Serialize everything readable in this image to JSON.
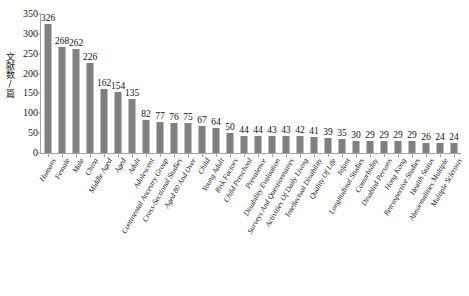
{
  "chart_data": {
    "type": "bar",
    "title": "",
    "subtitle": "",
    "xlabel": "",
    "ylabel": "文献数/篇",
    "ylim": [
      0,
      350
    ],
    "ytick_labels": [
      "0",
      "50",
      "100",
      "150",
      "200",
      "250",
      "300",
      "350"
    ],
    "ytick_values": [
      0,
      50,
      100,
      150,
      200,
      250,
      300,
      350
    ],
    "grid": false,
    "legend": null,
    "bar_color": "#808080",
    "axis_color": "#a6a6a6",
    "categories": [
      "Humans",
      "Female",
      "Male",
      "China",
      "Middle Aged",
      "Aged",
      "Adult",
      "Adolescent",
      "Continental Ancestry Group",
      "Cross-Sectional Studies",
      "Aged 80 And Over",
      "Child",
      "Young Adult",
      "Risk Factors",
      "Child Preschool",
      "Prevalence",
      "Disability Evaluation",
      "Surveys And Questionnaires",
      "Activities Of Daily Living",
      "Intellectual Disability",
      "Quality Of Life",
      "Infant",
      "Longitudinal Studies",
      "Comorbidity",
      "Disabled Persons",
      "Hong Kong",
      "Retrospective Studies",
      "Health Status",
      "Abnormalities Multiple",
      "Multiple Sclerosis"
    ],
    "values": [
      326,
      268,
      262,
      226,
      162,
      154,
      135,
      82,
      77,
      76,
      75,
      67,
      64,
      50,
      44,
      44,
      43,
      43,
      42,
      41,
      39,
      35,
      30,
      29,
      29,
      29,
      29,
      26,
      24,
      24
    ]
  }
}
